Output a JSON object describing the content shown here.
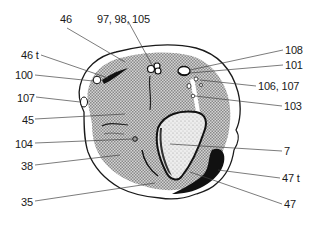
{
  "figure": {
    "type": "anatomical cross-section diagram",
    "colors": {
      "outline": "#1a1a1a",
      "tissue_fill": "#b8b8b8",
      "bone_fill": "#e6e6e6",
      "dark_structure": "#111111",
      "leader": "#444444",
      "background": "#ffffff"
    },
    "labels": [
      {
        "id": "46",
        "text": "46",
        "x": 60,
        "y": 13
      },
      {
        "id": "97-98-105",
        "text": "97, 98, 105",
        "x": 97,
        "y": 13
      },
      {
        "id": "46t",
        "text": "46 t",
        "x": 21,
        "y": 49
      },
      {
        "id": "100",
        "text": "100",
        "x": 15,
        "y": 69
      },
      {
        "id": "107-left",
        "text": "107",
        "x": 17,
        "y": 92
      },
      {
        "id": "45",
        "text": "45",
        "x": 22,
        "y": 114
      },
      {
        "id": "104",
        "text": "104",
        "x": 15,
        "y": 138
      },
      {
        "id": "38",
        "text": "38",
        "x": 21,
        "y": 160
      },
      {
        "id": "35",
        "text": "35",
        "x": 21,
        "y": 196
      },
      {
        "id": "108",
        "text": "108",
        "x": 285,
        "y": 44
      },
      {
        "id": "101",
        "text": "101",
        "x": 285,
        "y": 59
      },
      {
        "id": "106-107",
        "text": "106, 107",
        "x": 258,
        "y": 80
      },
      {
        "id": "103",
        "text": "103",
        "x": 284,
        "y": 100
      },
      {
        "id": "7",
        "text": "7",
        "x": 284,
        "y": 147
      },
      {
        "id": "47t",
        "text": "47 t",
        "x": 282,
        "y": 172
      },
      {
        "id": "47",
        "text": "47",
        "x": 284,
        "y": 198
      }
    ]
  }
}
